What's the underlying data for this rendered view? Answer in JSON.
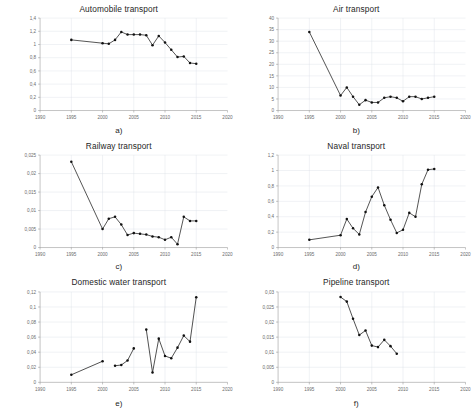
{
  "figure": {
    "title": "",
    "background": "#ffffff",
    "marker_color": "#111111",
    "line_color": "#2b2b2b",
    "grid_color": "#d9dee6"
  },
  "panels": [
    {
      "caption": "a)",
      "title": "Automobile transport"
    },
    {
      "caption": "b)",
      "title": "Air transport"
    },
    {
      "caption": "c)",
      "title": "Railway transport"
    },
    {
      "caption": "d)",
      "title": "Naval transport"
    },
    {
      "caption": "e)",
      "title": "Domestic water transport"
    },
    {
      "caption": "f)",
      "title": "Pipeline transport"
    }
  ],
  "chart_data": [
    {
      "type": "line",
      "title": "Automobile transport",
      "panel": "a)",
      "xlabel": "",
      "ylabel": "",
      "xlim": [
        1990,
        2020
      ],
      "ylim": [
        0,
        1.4
      ],
      "xticks": [
        1990,
        1995,
        2000,
        2005,
        2010,
        2015,
        2020
      ],
      "xtick_labels": [
        "1990",
        "1995",
        "2000",
        "2005",
        "2010",
        "2015",
        "2020"
      ],
      "yticks": [
        0,
        0.2,
        0.4,
        0.6,
        0.8,
        1.0,
        1.2,
        1.4
      ],
      "ytick_labels": [
        "0",
        "0,2",
        "0,4",
        "0,6",
        "0,8",
        "1",
        "1,2",
        "1,4"
      ],
      "grid": true,
      "legend": "none",
      "x": [
        1995,
        2000,
        2001,
        2002,
        2003,
        2004,
        2005,
        2006,
        2007,
        2008,
        2009,
        2010,
        2011,
        2012,
        2013,
        2014,
        2015
      ],
      "values": [
        1.07,
        1.02,
        1.01,
        1.07,
        1.19,
        1.15,
        1.15,
        1.15,
        1.14,
        0.99,
        1.13,
        1.03,
        0.92,
        0.81,
        0.82,
        0.72,
        0.71
      ]
    },
    {
      "type": "line",
      "title": "Air transport",
      "panel": "b)",
      "xlabel": "",
      "ylabel": "",
      "xlim": [
        1990,
        2020
      ],
      "ylim": [
        0,
        40
      ],
      "xticks": [
        1990,
        1995,
        2000,
        2005,
        2010,
        2015,
        2020
      ],
      "xtick_labels": [
        "1990",
        "1995",
        "2000",
        "2005",
        "2010",
        "2015",
        "2020"
      ],
      "yticks": [
        0,
        5,
        10,
        15,
        20,
        25,
        30,
        35,
        40
      ],
      "ytick_labels": [
        "0",
        "5",
        "10",
        "15",
        "20",
        "25",
        "30",
        "35",
        "40"
      ],
      "grid": true,
      "legend": "none",
      "x": [
        1995,
        2000,
        2001,
        2002,
        2003,
        2004,
        2005,
        2006,
        2007,
        2008,
        2009,
        2010,
        2011,
        2012,
        2013,
        2014,
        2015
      ],
      "values": [
        34.0,
        6.5,
        10.0,
        6.0,
        2.5,
        4.5,
        3.5,
        3.5,
        5.5,
        6.0,
        5.5,
        4.0,
        6.0,
        6.0,
        5.0,
        5.5,
        6.0
      ]
    },
    {
      "type": "line",
      "title": "Railway transport",
      "panel": "c)",
      "xlabel": "",
      "ylabel": "",
      "xlim": [
        1990,
        2020
      ],
      "ylim": [
        0,
        0.025
      ],
      "xticks": [
        1990,
        1995,
        2000,
        2005,
        2010,
        2015,
        2020
      ],
      "xtick_labels": [
        "1990",
        "1995",
        "2000",
        "2005",
        "2010",
        "2015",
        "2020"
      ],
      "yticks": [
        0,
        0.005,
        0.01,
        0.015,
        0.02,
        0.025
      ],
      "ytick_labels": [
        "0",
        "0,005",
        "0,01",
        "0,015",
        "0,02",
        "0,025"
      ],
      "grid": true,
      "legend": "none",
      "x": [
        1995,
        2000,
        2001,
        2002,
        2003,
        2004,
        2005,
        2006,
        2007,
        2008,
        2009,
        2010,
        2011,
        2012,
        2013,
        2014,
        2015
      ],
      "values": [
        0.0232,
        0.005,
        0.0078,
        0.0083,
        0.0062,
        0.0034,
        0.0039,
        0.0037,
        0.0035,
        0.003,
        0.0028,
        0.0021,
        0.0028,
        0.0009,
        0.0083,
        0.0072,
        0.0072
      ]
    },
    {
      "type": "line",
      "title": "Naval transport",
      "panel": "d)",
      "xlabel": "",
      "ylabel": "",
      "xlim": [
        1990,
        2020
      ],
      "ylim": [
        0,
        1.2
      ],
      "xticks": [
        1990,
        1995,
        2000,
        2005,
        2010,
        2015,
        2020
      ],
      "xtick_labels": [
        "1990",
        "1995",
        "2000",
        "2005",
        "2010",
        "2015",
        "2020"
      ],
      "yticks": [
        0,
        0.2,
        0.4,
        0.6,
        0.8,
        1.0,
        1.2
      ],
      "ytick_labels": [
        "0",
        "0,2",
        "0,4",
        "0,6",
        "0,8",
        "1",
        "1,2"
      ],
      "grid": true,
      "legend": "none",
      "x": [
        1995,
        2000,
        2001,
        2002,
        2003,
        2004,
        2005,
        2006,
        2007,
        2008,
        2009,
        2010,
        2011,
        2012,
        2013,
        2014,
        2015
      ],
      "values": [
        0.1,
        0.16,
        0.37,
        0.25,
        0.17,
        0.46,
        0.66,
        0.78,
        0.55,
        0.36,
        0.19,
        0.23,
        0.45,
        0.4,
        0.82,
        1.01,
        1.02
      ]
    },
    {
      "type": "line",
      "title": "Domestic water transport",
      "panel": "e)",
      "xlabel": "",
      "ylabel": "",
      "xlim": [
        1990,
        2020
      ],
      "ylim": [
        0,
        0.12
      ],
      "xticks": [
        1990,
        1995,
        2000,
        2005,
        2010,
        2015,
        2020
      ],
      "xtick_labels": [
        "1990",
        "1995",
        "2000",
        "2005",
        "2010",
        "2015",
        "2020"
      ],
      "yticks": [
        0,
        0.02,
        0.04,
        0.06,
        0.08,
        0.1,
        0.12
      ],
      "ytick_labels": [
        "0",
        "0,02",
        "0,04",
        "0,06",
        "0,08",
        "0,1",
        "0,12"
      ],
      "grid": true,
      "legend": "none",
      "segments": [
        {
          "x": [
            1995,
            2000
          ],
          "values": [
            0.01,
            0.028
          ]
        },
        {
          "x": [
            2002,
            2003,
            2004,
            2005
          ],
          "values": [
            0.022,
            0.023,
            0.029,
            0.045
          ]
        },
        {
          "x": [
            2007,
            2008,
            2009,
            2010,
            2011,
            2012,
            2013,
            2014,
            2015
          ],
          "values": [
            0.07,
            0.013,
            0.058,
            0.035,
            0.032,
            0.046,
            0.062,
            0.054,
            0.113
          ]
        }
      ]
    },
    {
      "type": "line",
      "title": "Pipeline transport",
      "panel": "f)",
      "xlabel": "",
      "ylabel": "",
      "xlim": [
        1990,
        2020
      ],
      "ylim": [
        0,
        0.03
      ],
      "xticks": [
        1990,
        1995,
        2000,
        2005,
        2010,
        2015,
        2020
      ],
      "xtick_labels": [
        "1990",
        "1995",
        "2000",
        "2005",
        "2010",
        "2015",
        "2020"
      ],
      "yticks": [
        0,
        0.005,
        0.01,
        0.015,
        0.02,
        0.025,
        0.03
      ],
      "ytick_labels": [
        "0",
        "0,005",
        "0,01",
        "0,015",
        "0,02",
        "0,025",
        "0,03"
      ],
      "grid": true,
      "legend": "none",
      "x": [
        2000,
        2001,
        2002,
        2003,
        2004,
        2005,
        2006,
        2007,
        2008,
        2009
      ],
      "values": [
        0.0283,
        0.0268,
        0.0211,
        0.0157,
        0.0172,
        0.0122,
        0.0117,
        0.0141,
        0.012,
        0.0095,
        0.007,
        0.0087
      ]
    }
  ]
}
